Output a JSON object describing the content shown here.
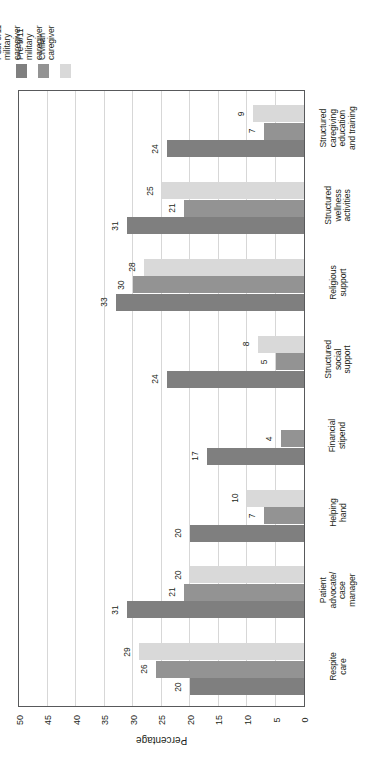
{
  "chart_data": {
    "type": "bar",
    "orientation": "horizontal",
    "title": "",
    "xlabel": "Percentage",
    "ylabel": "",
    "xlim": [
      0,
      50
    ],
    "xticks": [
      50,
      45,
      40,
      35,
      30,
      25,
      20,
      15,
      10,
      5,
      0
    ],
    "grid": true,
    "legend_position": "top-left",
    "categories": [
      "Structured\ncaregiving\neducation\nand training",
      "Structured\nwellness\nactivities",
      "Religious\nsupport",
      "Structured\nsocial\nsupport",
      "Financial\nstipend",
      "Helping\nhand",
      "Patient\nadvocate/\ncase\nmanager",
      "Respite\ncare"
    ],
    "series": [
      {
        "name": "Post-9/11\nmilitary\ncaregiver",
        "color": "#7f7f7f",
        "values": [
          24,
          31,
          33,
          24,
          17,
          20,
          31,
          20
        ]
      },
      {
        "name": "Pre-9/11\nmilitary\ncaregiver",
        "color": "#939393",
        "values": [
          7,
          21,
          30,
          5,
          4,
          7,
          21,
          26
        ]
      },
      {
        "name": "Civilian\ncaregiver",
        "color": "#d9d9d9",
        "values": [
          9,
          25,
          28,
          8,
          0,
          10,
          20,
          29
        ]
      }
    ],
    "value_labels": {
      "Structured caregiving education and training": {
        "post": "24",
        "pre": "7",
        "civilian": "9"
      },
      "Structured wellness activities": {
        "post": "31",
        "pre": "21",
        "civilian": "25"
      },
      "Religious support": {
        "post": "33",
        "pre": "30",
        "civilian": "28"
      },
      "Structured social support": {
        "post": "24",
        "pre": "5",
        "civilian": "8"
      },
      "Financial stipend": {
        "post": "17",
        "pre": "4",
        "civilian": ""
      },
      "Helping hand": {
        "post": "20",
        "pre": "7",
        "civilian": ""
      },
      "Patient advocate/case manager": {
        "post": "31",
        "pre": "21",
        "civilian": "20"
      },
      "Respite care": {
        "post": "20",
        "pre": "26",
        "civilian": "29"
      }
    }
  },
  "legend": {
    "items": [
      {
        "label": "Post-9/11\nmilitary\ncaregiver",
        "color": "#7f7f7f"
      },
      {
        "label": "Pre-9/11\nmilitary\ncaregiver",
        "color": "#939393"
      },
      {
        "label": "Civilian\ncaregiver",
        "color": "#d9d9d9"
      }
    ]
  },
  "axis": {
    "title": "Percentage",
    "ticks": [
      "50",
      "45",
      "40",
      "35",
      "30",
      "25",
      "20",
      "15",
      "10",
      "5",
      "0"
    ]
  },
  "colors": {
    "post_911": "#7f7f7f",
    "pre_911": "#939393",
    "civilian": "#d9d9d9",
    "frame": "#58595b",
    "grid": "#d7d7d7",
    "text": "#231f20",
    "background": "#ffffff"
  }
}
